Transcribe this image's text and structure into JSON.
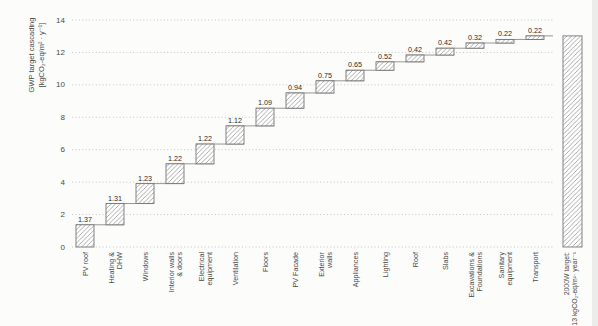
{
  "figure": {
    "background": "#fcfcfb"
  },
  "chart_data": {
    "type": "bar",
    "subtype": "waterfall-cascade",
    "title": "",
    "ylabel_lines": [
      "GWP target cascading",
      "[kgCO₂-eq/m² · y⁻¹]"
    ],
    "xlabel": "",
    "ylim": [
      0,
      14
    ],
    "yticks": [
      0,
      2,
      4,
      6,
      8,
      10,
      12,
      14
    ],
    "grid": "horizontal-dotted",
    "legend": "none",
    "categories": [
      "PV roof",
      "Heating &\nDHW",
      "Windows",
      "Interior walls\n& doors",
      "Electrical\nequipment",
      "Ventilation",
      "Floors",
      "PV Facade",
      "Exterior\nwalls",
      "Appliances",
      "Lighting",
      "Roof",
      "Slabs",
      "Excavations &\nFoundations",
      "Sanitary\nequipment",
      "Transport"
    ],
    "values": [
      1.37,
      1.31,
      1.23,
      1.22,
      1.22,
      1.12,
      1.09,
      0.94,
      0.75,
      0.65,
      0.52,
      0.42,
      0.42,
      0.32,
      0.22,
      0.22
    ],
    "value_labels": [
      "1.37",
      "1.31",
      "1.23",
      "1.22",
      "1.22",
      "1.12",
      "1.09",
      "0.94",
      "0.75",
      "0.65",
      "0.52",
      "0.42",
      "0.42",
      "0.32",
      "0.22",
      "0.22"
    ],
    "total_bar": {
      "value": 13.02,
      "label_lines": [
        "2000W target:",
        "13 kgCO₂-eq/m²· year⁻¹"
      ]
    },
    "colors": {
      "bar_fill": "#ffffff",
      "hatch_line": "#8f8f8f",
      "bar_stroke": "#757575",
      "connector": "#8a8a8a",
      "grid_line": "#c6c6c4",
      "value_text": "#2b2b2b",
      "tick_text": "#4a4a4a",
      "category_text": "#4a4a4a",
      "axis_title_text": "#4a4a4a"
    }
  }
}
